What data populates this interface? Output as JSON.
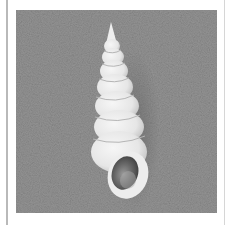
{
  "image": {
    "subject": "spiral gastropod shell",
    "background": "gray sand texture",
    "colors": {
      "page": "#ffffff",
      "background": "#8f8f8f",
      "shell": "#ececec",
      "shell_shadow": "#bdbdbd",
      "aperture_inner": "#5a5a5a",
      "frame_line": "#b9b9b9"
    }
  }
}
